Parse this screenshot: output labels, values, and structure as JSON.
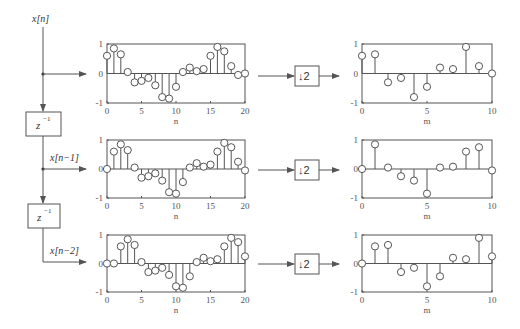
{
  "diagram": {
    "input_label": "x[n]",
    "delay_label": "z",
    "delay_exponent": "−1",
    "branch_labels": [
      "x[n]",
      "x[n−1]",
      "x[n−2]"
    ],
    "downsampler_label": "↓2",
    "left_xlabel": "n",
    "right_xlabel": "m"
  },
  "chart_data": [
    {
      "type": "stem",
      "title": "",
      "xlabel": "n",
      "ylabel": "",
      "xlim": [
        0,
        20
      ],
      "ylim": [
        -1,
        1
      ],
      "xticks": [
        0,
        5,
        10,
        15,
        20
      ],
      "yticks": [
        -1,
        0,
        1
      ],
      "x": [
        0,
        1,
        2,
        3,
        4,
        5,
        6,
        7,
        8,
        9,
        10,
        11,
        12,
        13,
        14,
        15,
        16,
        17,
        18,
        19,
        20
      ],
      "values": [
        0.6,
        0.85,
        0.65,
        0.05,
        -0.3,
        -0.25,
        -0.15,
        -0.4,
        -0.8,
        -0.85,
        -0.45,
        0.05,
        0.2,
        0.08,
        0.15,
        0.6,
        0.9,
        0.75,
        0.25,
        -0.05,
        0.0
      ]
    },
    {
      "type": "stem",
      "title": "",
      "xlabel": "m",
      "ylabel": "",
      "xlim": [
        0,
        10
      ],
      "ylim": [
        -1,
        1
      ],
      "xticks": [
        0,
        5,
        10
      ],
      "yticks": [
        -1,
        0,
        1
      ],
      "x": [
        0,
        1,
        2,
        3,
        4,
        5,
        6,
        7,
        8,
        9,
        10
      ],
      "values": [
        0.6,
        0.65,
        -0.3,
        -0.15,
        -0.8,
        -0.45,
        0.2,
        0.15,
        0.9,
        0.25,
        0.0
      ]
    },
    {
      "type": "stem",
      "title": "",
      "xlabel": "n",
      "ylabel": "",
      "xlim": [
        0,
        20
      ],
      "ylim": [
        -1,
        1
      ],
      "xticks": [
        0,
        5,
        10,
        15,
        20
      ],
      "yticks": [
        -1,
        0,
        1
      ],
      "x": [
        0,
        1,
        2,
        3,
        4,
        5,
        6,
        7,
        8,
        9,
        10,
        11,
        12,
        13,
        14,
        15,
        16,
        17,
        18,
        19,
        20
      ],
      "values": [
        0.0,
        0.6,
        0.85,
        0.65,
        0.05,
        -0.3,
        -0.25,
        -0.15,
        -0.4,
        -0.8,
        -0.85,
        -0.45,
        0.05,
        0.2,
        0.08,
        0.15,
        0.6,
        0.9,
        0.75,
        0.25,
        -0.05
      ]
    },
    {
      "type": "stem",
      "title": "",
      "xlabel": "m",
      "ylabel": "",
      "xlim": [
        0,
        10
      ],
      "ylim": [
        -1,
        1
      ],
      "xticks": [
        0,
        5,
        10
      ],
      "yticks": [
        -1,
        0,
        1
      ],
      "x": [
        0,
        1,
        2,
        3,
        4,
        5,
        6,
        7,
        8,
        9,
        10
      ],
      "values": [
        0.0,
        0.85,
        0.05,
        -0.25,
        -0.4,
        -0.85,
        0.05,
        0.08,
        0.6,
        0.75,
        -0.05
      ]
    },
    {
      "type": "stem",
      "title": "",
      "xlabel": "n",
      "ylabel": "",
      "xlim": [
        0,
        20
      ],
      "ylim": [
        -1,
        1
      ],
      "xticks": [
        0,
        5,
        10,
        15,
        20
      ],
      "yticks": [
        -1,
        0,
        1
      ],
      "x": [
        0,
        1,
        2,
        3,
        4,
        5,
        6,
        7,
        8,
        9,
        10,
        11,
        12,
        13,
        14,
        15,
        16,
        17,
        18,
        19,
        20
      ],
      "values": [
        0.0,
        0.0,
        0.6,
        0.85,
        0.65,
        0.05,
        -0.3,
        -0.25,
        -0.15,
        -0.4,
        -0.8,
        -0.85,
        -0.45,
        0.05,
        0.2,
        0.08,
        0.15,
        0.6,
        0.9,
        0.75,
        0.25
      ]
    },
    {
      "type": "stem",
      "title": "",
      "xlabel": "m",
      "ylabel": "",
      "xlim": [
        0,
        10
      ],
      "ylim": [
        -1,
        1
      ],
      "xticks": [
        0,
        5,
        10
      ],
      "yticks": [
        -1,
        0,
        1
      ],
      "x": [
        0,
        1,
        2,
        3,
        4,
        5,
        6,
        7,
        8,
        9,
        10
      ],
      "values": [
        0.0,
        0.6,
        0.65,
        -0.3,
        -0.15,
        -0.8,
        -0.45,
        0.2,
        0.15,
        0.9,
        0.25
      ]
    }
  ]
}
